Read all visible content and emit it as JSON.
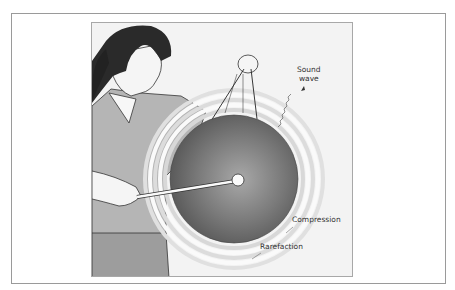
{
  "figure": {
    "labels": {
      "sound_wave_line1": "Sound",
      "sound_wave_line2": "wave",
      "compression": "Compression",
      "rarefaction": "Rarefaction"
    },
    "colors": {
      "background": "#f3f3f3",
      "gong_dark": "#5f5f5f",
      "gong_light": "#a5a5a5",
      "sweater": "#b5b5b5",
      "hair": "#2a2a2a",
      "ring": "#e4e4e4"
    }
  }
}
